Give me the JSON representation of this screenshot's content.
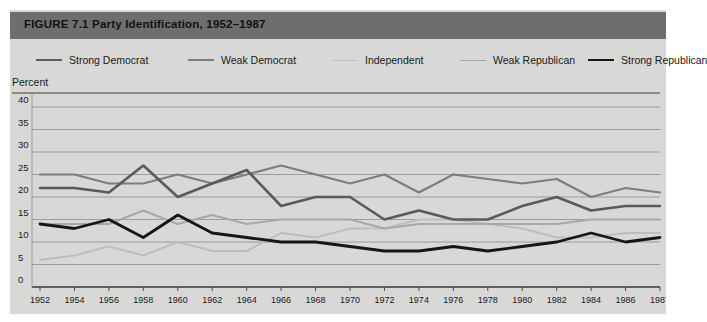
{
  "figure": {
    "title": "FIGURE 7.1  Party Identification, 1952–1987",
    "header_color": "#6e6e6e",
    "background_color": "#d8d8d6",
    "axis_label": "Percent"
  },
  "legend": {
    "position": "top",
    "items": [
      {
        "label": "Strong Democrat",
        "color": "#5a5a58",
        "width": 2.6,
        "x": 26
      },
      {
        "label": "Weak Democrat",
        "color": "#7d7d7b",
        "width": 2.2,
        "x": 178
      },
      {
        "label": "Independent",
        "color": "#bdbdbb",
        "width": 1.9,
        "x": 322
      },
      {
        "label": "Weak Republican",
        "color": "#a8a8a6",
        "width": 1.9,
        "x": 450
      },
      {
        "label": "Strong Republican",
        "color": "#161616",
        "width": 2.8,
        "x": 578
      }
    ]
  },
  "chart_data": {
    "type": "line",
    "title": "FIGURE 7.1  Party Identification, 1952–1987",
    "xlabel": "",
    "ylabel": "Percent",
    "ylim": [
      0,
      40
    ],
    "yticks": [
      0,
      5,
      10,
      15,
      20,
      25,
      30,
      35,
      40
    ],
    "grid": true,
    "xlim": [
      1952,
      1987
    ],
    "x": [
      1952,
      1954,
      1956,
      1958,
      1960,
      1962,
      1964,
      1966,
      1968,
      1970,
      1972,
      1974,
      1976,
      1978,
      1980,
      1982,
      1984,
      1986,
      1987
    ],
    "xticklabels": [
      "1952",
      "1954",
      "1956",
      "1958",
      "1960",
      "1962",
      "1964",
      "1966",
      "1968",
      "1970",
      "1972",
      "1974",
      "1976",
      "1978",
      "1980",
      "1982",
      "1984",
      "1986",
      "1987"
    ],
    "series": [
      {
        "name": "Strong Democrat",
        "color": "#5a5a58",
        "values": [
          22,
          22,
          21,
          27,
          20,
          23,
          26,
          18,
          20,
          20,
          15,
          17,
          15,
          15,
          18,
          20,
          17,
          18,
          18
        ]
      },
      {
        "name": "Weak Democrat",
        "color": "#7d7d7b",
        "values": [
          25,
          25,
          23,
          23,
          25,
          23,
          25,
          27,
          25,
          23,
          25,
          21,
          25,
          24,
          23,
          24,
          20,
          22,
          21
        ]
      },
      {
        "name": "Independent",
        "color": "#bdbdbb",
        "values": [
          6,
          7,
          9,
          7,
          10,
          8,
          8,
          12,
          11,
          13,
          13,
          15,
          15,
          14,
          13,
          11,
          11,
          12,
          12
        ]
      },
      {
        "name": "Weak Republican",
        "color": "#a8a8a6",
        "values": [
          14,
          14,
          14,
          17,
          14,
          16,
          14,
          15,
          15,
          15,
          13,
          14,
          14,
          14,
          14,
          14,
          15,
          15,
          15
        ]
      },
      {
        "name": "Strong Republican",
        "color": "#161616",
        "values": [
          14,
          13,
          15,
          11,
          16,
          12,
          11,
          10,
          10,
          9,
          8,
          8,
          9,
          8,
          9,
          10,
          12,
          10,
          11
        ]
      }
    ],
    "annotations": []
  }
}
